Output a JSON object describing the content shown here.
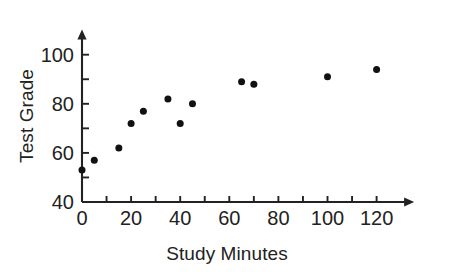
{
  "chart_data": {
    "type": "scatter",
    "title": "",
    "xlabel": "Study Minutes",
    "ylabel": "Test Grade",
    "xlim": [
      0,
      130
    ],
    "ylim": [
      40,
      105
    ],
    "grid": false,
    "legend": null,
    "x_ticks_major": [
      0,
      20,
      40,
      60,
      80,
      100,
      120
    ],
    "x_ticks_minor": [
      10,
      30,
      50,
      70,
      90,
      110
    ],
    "y_ticks_major": [
      40,
      60,
      80,
      100
    ],
    "y_ticks_minor": [
      50,
      70,
      90
    ],
    "x_tick_labels": [
      "0",
      "20",
      "40",
      "60",
      "80",
      "100",
      "120"
    ],
    "y_tick_labels": [
      "40",
      "60",
      "80",
      "100"
    ],
    "marker": {
      "shape": "circle",
      "color": "#111111",
      "size": 7
    },
    "axis_color": "#222222",
    "axis_arrows": [
      "x-right",
      "y-top"
    ],
    "points": [
      {
        "x": 0,
        "y": 53
      },
      {
        "x": 5,
        "y": 57
      },
      {
        "x": 15,
        "y": 62
      },
      {
        "x": 20,
        "y": 72
      },
      {
        "x": 25,
        "y": 77
      },
      {
        "x": 35,
        "y": 82
      },
      {
        "x": 40,
        "y": 72
      },
      {
        "x": 45,
        "y": 80
      },
      {
        "x": 65,
        "y": 89
      },
      {
        "x": 70,
        "y": 88
      },
      {
        "x": 100,
        "y": 91
      },
      {
        "x": 120,
        "y": 94
      }
    ]
  }
}
